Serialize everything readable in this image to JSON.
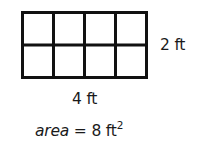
{
  "figure": {
    "grid": {
      "rows": 2,
      "columns": 4,
      "line_color": "#111111",
      "fill_color": "#ffffff"
    },
    "labels": {
      "height": "2 ft",
      "width": "4 ft"
    },
    "formula": {
      "variable": "area",
      "operator": "=",
      "value": "8",
      "unit": "ft",
      "exponent": "2"
    }
  }
}
